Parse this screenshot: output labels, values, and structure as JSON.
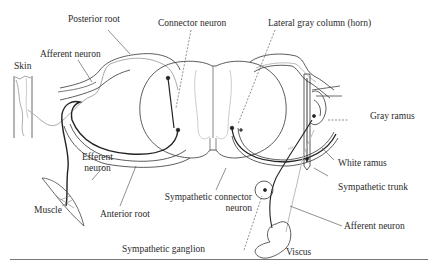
{
  "diagram": {
    "labels": {
      "posterior_root": "Posterior root",
      "connector_neuron": "Connector neuron",
      "lateral_gray_column": "Lateral gray column (horn)",
      "afferent_neuron_top": "Afferent neuron",
      "skin": "Skin",
      "gray_ramus": "Gray ramus",
      "efferent_neuron_line1": "Efferent",
      "efferent_neuron_line2": "neuron",
      "white_ramus": "White ramus",
      "sympathetic_trunk": "Sympathetic trunk",
      "sympathetic_connector_line1": "Sympathetic connector",
      "sympathetic_connector_line2": "neuron",
      "muscle": "Muscle",
      "anterior_root": "Anterior root",
      "afferent_neuron_bottom": "Afferent neuron",
      "sympathetic_ganglion": "Sympathetic ganglion",
      "viscus": "Viscus"
    },
    "colors": {
      "line": "#2a2a2a",
      "light_line": "#9a9a9a",
      "background": "#ffffff"
    }
  }
}
